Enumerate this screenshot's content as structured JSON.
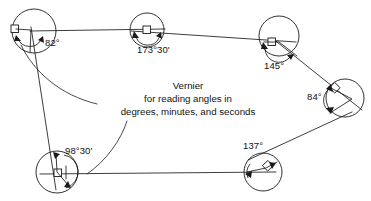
{
  "figure": {
    "kind": "surveying-traverse-diagram",
    "width": 371,
    "height": 201,
    "background_color": "#ffffff",
    "line_color": "#1a1a1a",
    "text_color": "#111111"
  },
  "callout": {
    "line1": "Vernier",
    "line2": "for reading angles in",
    "line3": "degrees, minutes, and seconds"
  },
  "stations": [
    {
      "id": "station-a",
      "label": "82°",
      "angle_degrees": 82,
      "angle_minutes": 0,
      "instrument": "square",
      "cx": 34,
      "cy": 31,
      "r": 22,
      "label_x": 45,
      "label_y": 42
    },
    {
      "id": "station-b",
      "label": "173°30'",
      "angle_degrees": 173,
      "angle_minutes": 30,
      "instrument": "square",
      "cx": 147,
      "cy": 30,
      "r": 17,
      "label_x": 138,
      "label_y": 48
    },
    {
      "id": "station-c",
      "label": "145°",
      "angle_degrees": 145,
      "angle_minutes": 0,
      "instrument": "square",
      "cx": 279,
      "cy": 36,
      "r": 20,
      "label_x": 265,
      "label_y": 63
    },
    {
      "id": "station-d",
      "label": "84°",
      "angle_degrees": 84,
      "angle_minutes": 0,
      "instrument": "diamond",
      "cx": 345,
      "cy": 98,
      "r": 19,
      "label_x": 310,
      "label_y": 93
    },
    {
      "id": "station-e",
      "label": "137°",
      "angle_degrees": 137,
      "angle_minutes": 0,
      "instrument": "diamond",
      "cx": 263,
      "cy": 172,
      "r": 19,
      "label_x": 245,
      "label_y": 144
    },
    {
      "id": "station-f",
      "label": "98°30'",
      "angle_degrees": 98,
      "angle_minutes": 30,
      "instrument": "square",
      "cx": 57,
      "cy": 172,
      "r": 21,
      "label_x": 66,
      "label_y": 149
    }
  ],
  "traverse_legs": [
    {
      "from": "station-a",
      "to": "station-b"
    },
    {
      "from": "station-b",
      "to": "station-c"
    },
    {
      "from": "station-c",
      "to": "station-d"
    },
    {
      "from": "station-d",
      "to": "station-e"
    },
    {
      "from": "station-e",
      "to": "station-f"
    },
    {
      "from": "station-f",
      "to": "station-a"
    }
  ]
}
